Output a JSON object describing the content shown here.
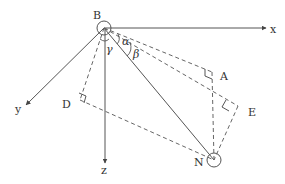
{
  "diagram": {
    "type": "3d-coordinate-geometry",
    "colors": {
      "line": "#555555",
      "dashed": "#666666",
      "background": "#ffffff"
    },
    "points": {
      "B": {
        "label": "B",
        "x": 104,
        "y": 28
      },
      "N": {
        "label": "N",
        "x": 214,
        "y": 160
      },
      "A": {
        "label": "A",
        "x": 212,
        "y": 76
      },
      "D": {
        "label": "D",
        "x": 80,
        "y": 104
      },
      "E": {
        "label": "E",
        "x": 237,
        "y": 110
      }
    },
    "axes": {
      "x": {
        "label": "x"
      },
      "y": {
        "label": "y"
      },
      "z": {
        "label": "z"
      }
    },
    "angles": {
      "alpha": {
        "label": "α"
      },
      "beta": {
        "label": "β"
      },
      "gamma": {
        "label": "γ"
      }
    }
  }
}
